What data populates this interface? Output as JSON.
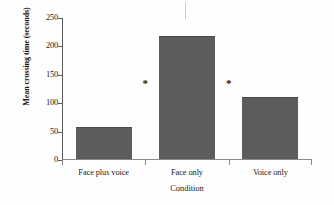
{
  "chart_data": {
    "type": "bar",
    "title": "",
    "subtitle": "",
    "xlabel": "Condition",
    "ylabel": "Mean crossing time (seconds)",
    "categories": [
      "Face plus voice",
      "Face only",
      "Voice only"
    ],
    "values": [
      55,
      215,
      108
    ],
    "ylim": [
      0,
      250
    ],
    "yticks": [
      0,
      50,
      100,
      150,
      200,
      250
    ],
    "ytick_labels": [
      "0",
      "50",
      "100",
      "150",
      "200",
      "250"
    ],
    "grid": false,
    "legend": null,
    "bar_color": "#5c5c5c",
    "axis_color": "#5b5b5b",
    "annotations": [
      {
        "label": "*",
        "between": [
          "Face plus voice",
          "Face only"
        ],
        "y": 135
      },
      {
        "label": "*",
        "between": [
          "Face only",
          "Voice only"
        ],
        "y": 135
      }
    ]
  },
  "figure": {
    "background": "#ffffff",
    "artifact_mark": ""
  }
}
